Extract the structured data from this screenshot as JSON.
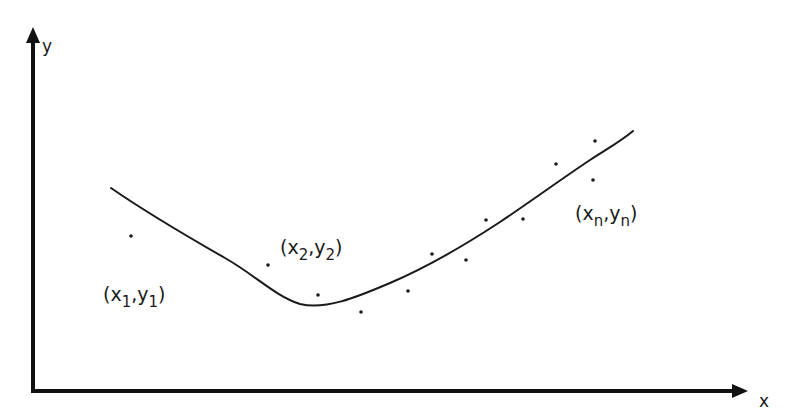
{
  "diagram": {
    "type": "curve-fitting-scatter",
    "axes": {
      "x_label": "x",
      "y_label": "y"
    },
    "point_labels": [
      {
        "id": "first",
        "open": "(",
        "xvar": "x",
        "xsub": "1",
        "sep": ",",
        "yvar": "y",
        "ysub": "1",
        "close": ")"
      },
      {
        "id": "second",
        "open": "(",
        "xvar": "x",
        "xsub": "2",
        "sep": ",",
        "yvar": "y",
        "ysub": "2",
        "close": ")"
      },
      {
        "id": "nth",
        "open": "(",
        "xvar": "x",
        "xsub": "n",
        "sep": ",",
        "yvar": "y",
        "ysub": "n",
        "close": ")"
      }
    ],
    "data_points": [
      {
        "cx": 131,
        "cy": 236
      },
      {
        "cx": 268,
        "cy": 265
      },
      {
        "cx": 318,
        "cy": 295
      },
      {
        "cx": 361,
        "cy": 312
      },
      {
        "cx": 408,
        "cy": 291
      },
      {
        "cx": 432,
        "cy": 254
      },
      {
        "cx": 466,
        "cy": 260
      },
      {
        "cx": 486,
        "cy": 220
      },
      {
        "cx": 523,
        "cy": 219
      },
      {
        "cx": 556,
        "cy": 164
      },
      {
        "cx": 595,
        "cy": 141
      },
      {
        "cx": 593,
        "cy": 180
      }
    ],
    "curve_description": "smooth fitted curve descending from upper left, minimum near the middle, rising to upper right"
  }
}
